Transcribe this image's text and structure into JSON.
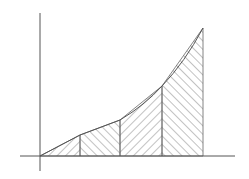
{
  "diagram": {
    "colors": {
      "line": "#555555",
      "hatch": "#666666",
      "background": "#ffffff"
    },
    "axes": {
      "x_axis": {
        "x1": 20,
        "x2": 235,
        "y": 156
      },
      "y_axis": {
        "x": 40,
        "y1": 13,
        "y2": 171
      }
    },
    "curve_points": [
      [
        40,
        156
      ],
      [
        80,
        135
      ],
      [
        120,
        120
      ],
      [
        162,
        86
      ],
      [
        203,
        28
      ]
    ],
    "strips": [
      {
        "x1": 40,
        "x2": 80,
        "hatch": "forward"
      },
      {
        "x1": 80,
        "x2": 120,
        "hatch": "backward"
      },
      {
        "x1": 120,
        "x2": 162,
        "hatch": "forward"
      },
      {
        "x1": 162,
        "x2": 203,
        "hatch": "backward"
      }
    ]
  }
}
